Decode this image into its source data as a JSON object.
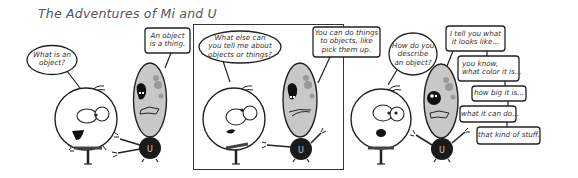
{
  "title": "The Adventures of Mi and U",
  "colors": {
    "ink": "#222222",
    "egg_fill": "#c8c8c8",
    "egg_spots": "#9a9a9a",
    "ball_fill": "#1a1a1a",
    "panel_border": "#333333",
    "title_text": "#555555"
  },
  "characters": {
    "mi": {
      "name": "Mi",
      "shape": "round-head-stick-body"
    },
    "u": {
      "name": "U",
      "shape": "gray-egg-on-black-ball",
      "ball_letter": "U"
    }
  },
  "panels": [
    {
      "id": "panel-1",
      "framed": false,
      "dialogue": [
        {
          "speaker": "Mi",
          "style": "oval",
          "lines": [
            "What is an",
            "object?"
          ]
        },
        {
          "speaker": "U",
          "style": "box",
          "lines": [
            "An object",
            "is a thing."
          ]
        }
      ]
    },
    {
      "id": "panel-2",
      "framed": true,
      "dialogue": [
        {
          "speaker": "Mi",
          "style": "oval",
          "lines": [
            "What else can",
            "you tell me about",
            "objects or things?"
          ]
        },
        {
          "speaker": "U",
          "style": "box",
          "lines": [
            "You can do things",
            "to objects, like",
            "pick them up."
          ]
        }
      ]
    },
    {
      "id": "panel-3",
      "framed": false,
      "dialogue": [
        {
          "speaker": "Mi",
          "style": "oval",
          "lines": [
            "How do you",
            "describe",
            "an object?"
          ]
        },
        {
          "speaker": "U",
          "style": "box",
          "lines": [
            "I tell you what",
            "it looks like..."
          ]
        },
        {
          "speaker": "U",
          "style": "box",
          "lines": [
            "you know,",
            "what color it is..."
          ]
        },
        {
          "speaker": "U",
          "style": "box",
          "lines": [
            "how big it is..."
          ]
        },
        {
          "speaker": "U",
          "style": "box",
          "lines": [
            "what it can do..."
          ]
        },
        {
          "speaker": "U",
          "style": "box",
          "lines": [
            "that kind of stuff."
          ]
        }
      ]
    }
  ]
}
